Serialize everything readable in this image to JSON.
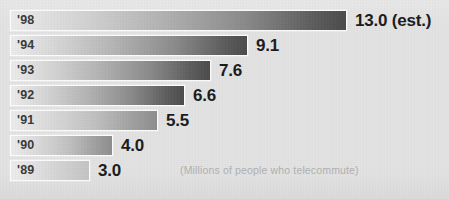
{
  "chart_data": {
    "type": "bar",
    "orientation": "horizontal",
    "title": "",
    "subtitle": "",
    "caption": "(Millions of people who telecommute)",
    "xlabel": "",
    "ylabel": "",
    "grid": false,
    "legend": false,
    "axis_visible": false,
    "xlim": [
      0,
      13.0
    ],
    "categories": [
      "'98",
      "'94",
      "'93",
      "'92",
      "'91",
      "'90",
      "'89"
    ],
    "values": [
      13.0,
      9.1,
      7.6,
      6.6,
      5.5,
      4.0,
      3.0
    ],
    "value_labels": [
      "13.0 (est.)",
      "9.1",
      "7.6",
      "6.6",
      "5.5",
      "4.0",
      "3.0"
    ],
    "units": "millions of people",
    "bars": [
      {
        "category": "'98",
        "value": 13.0,
        "value_label": "13.0 (est.)",
        "estimated": true,
        "bar_width_px": 337,
        "row_top_px": 10,
        "label_left_px": 355,
        "shade": "full"
      },
      {
        "category": "'94",
        "value": 9.1,
        "value_label": "9.1",
        "estimated": false,
        "bar_width_px": 238,
        "row_top_px": 35,
        "label_left_px": 256,
        "shade": "full"
      },
      {
        "category": "'93",
        "value": 7.6,
        "value_label": "7.6",
        "estimated": false,
        "bar_width_px": 201,
        "row_top_px": 60,
        "label_left_px": 219,
        "shade": "full"
      },
      {
        "category": "'92",
        "value": 6.6,
        "value_label": "6.6",
        "estimated": false,
        "bar_width_px": 175,
        "row_top_px": 85,
        "label_left_px": 193,
        "shade": "full"
      },
      {
        "category": "'91",
        "value": 5.5,
        "value_label": "5.5",
        "estimated": false,
        "bar_width_px": 148,
        "row_top_px": 110,
        "label_left_px": 166,
        "shade": "mid"
      },
      {
        "category": "'90",
        "value": 4.0,
        "value_label": "4.0",
        "estimated": false,
        "bar_width_px": 103,
        "row_top_px": 135,
        "label_left_px": 121,
        "shade": "mid"
      },
      {
        "category": "'89",
        "value": 3.0,
        "value_label": "3.0",
        "estimated": false,
        "bar_width_px": 80,
        "row_top_px": 160,
        "label_left_px": 98,
        "shade": "short"
      }
    ],
    "colors": {
      "background": "#e3e3e3",
      "bar_gradient_start": "#ececec",
      "bar_gradient_end": "#4b4b4b",
      "bar_border": "#fdfdfd",
      "value_text": "#1a1a1a",
      "category_text": "#3a3a3a",
      "caption_text": "#b0b0b0"
    }
  }
}
